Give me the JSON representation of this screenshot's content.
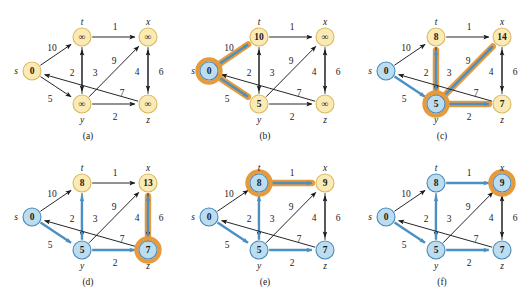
{
  "figure": {
    "width": 531,
    "height": 292,
    "colors": {
      "node_yellow_fill": "#fbeab4",
      "node_yellow_stroke": "#d8ba62",
      "node_blue_fill": "#bcdcf0",
      "node_blue_stroke": "#4a89b8",
      "highlight_orange": "#e79a3c",
      "edge_blue": "#4a90c2",
      "edge_black": "#1a1a1a",
      "text": "#1a1a1a"
    }
  },
  "graph": {
    "vertex_names": [
      "s",
      "t",
      "x",
      "y",
      "z"
    ],
    "positions": {
      "s": [
        32,
        71
      ],
      "t": [
        82,
        37
      ],
      "x": [
        148,
        37
      ],
      "y": [
        82,
        104
      ],
      "z": [
        148,
        104
      ]
    },
    "edges": [
      {
        "id": "s-t",
        "from": "s",
        "to": "t",
        "weight": "10",
        "label_pos": [
          52,
          48
        ]
      },
      {
        "id": "s-y",
        "from": "s",
        "to": "y",
        "weight": "5",
        "label_pos": [
          50,
          99
        ]
      },
      {
        "id": "t-x",
        "from": "t",
        "to": "x",
        "weight": "1",
        "label_pos": [
          115,
          27
        ]
      },
      {
        "id": "t-y",
        "from": "t",
        "to": "y",
        "weight": "2",
        "label_pos": [
          72,
          73
        ]
      },
      {
        "id": "y-t",
        "from": "y",
        "to": "t",
        "weight": "3",
        "label_pos": [
          95,
          73
        ]
      },
      {
        "id": "y-x",
        "from": "y",
        "to": "x",
        "weight": "9",
        "label_pos": [
          114,
          61
        ]
      },
      {
        "id": "x-z",
        "from": "x",
        "to": "z",
        "weight": "4",
        "label_pos": [
          137,
          72
        ]
      },
      {
        "id": "z-x",
        "from": "z",
        "to": "x",
        "weight": "6",
        "label_pos": [
          161,
          72
        ]
      },
      {
        "id": "y-z",
        "from": "y",
        "to": "z",
        "weight": "2",
        "label_pos": [
          115,
          117
        ]
      },
      {
        "id": "z-s",
        "from": "z",
        "to": "s",
        "weight": "7",
        "label_pos": [
          122,
          93
        ]
      }
    ]
  },
  "panels": [
    {
      "id": "a",
      "caption": "(a)",
      "origin": [
        0,
        0
      ],
      "values": {
        "s": "0",
        "t": "∞",
        "x": "∞",
        "y": "∞",
        "z": "∞"
      },
      "node_colors": {
        "s": "yellow",
        "t": "yellow",
        "x": "yellow",
        "y": "yellow",
        "z": "yellow"
      },
      "ring": null,
      "blue_edges": [],
      "orange_edges": []
    },
    {
      "id": "b",
      "caption": "(b)",
      "origin": [
        177,
        0
      ],
      "values": {
        "s": "0",
        "t": "10",
        "x": "∞",
        "y": "5",
        "z": "∞"
      },
      "node_colors": {
        "s": "blue",
        "t": "yellow",
        "x": "yellow",
        "y": "yellow",
        "z": "yellow"
      },
      "ring": "s",
      "blue_edges": [
        "s-t",
        "s-y"
      ],
      "orange_edges": [
        "s-t",
        "s-y"
      ]
    },
    {
      "id": "c",
      "caption": "(c)",
      "origin": [
        354,
        0
      ],
      "values": {
        "s": "0",
        "t": "8",
        "x": "14",
        "y": "5",
        "z": "7"
      },
      "node_colors": {
        "s": "blue",
        "t": "yellow",
        "x": "yellow",
        "y": "blue",
        "z": "yellow"
      },
      "ring": "y",
      "blue_edges": [
        "s-y",
        "y-t",
        "y-x",
        "y-z"
      ],
      "orange_edges": [
        "y-t",
        "y-x",
        "y-z"
      ]
    },
    {
      "id": "d",
      "caption": "(d)",
      "origin": [
        0,
        146
      ],
      "values": {
        "s": "0",
        "t": "8",
        "x": "13",
        "y": "5",
        "z": "7"
      },
      "node_colors": {
        "s": "blue",
        "t": "yellow",
        "x": "yellow",
        "y": "blue",
        "z": "blue"
      },
      "ring": "z",
      "blue_edges": [
        "s-y",
        "y-t",
        "y-z",
        "z-x"
      ],
      "orange_edges": [
        "z-x"
      ]
    },
    {
      "id": "e",
      "caption": "(e)",
      "origin": [
        177,
        146
      ],
      "values": {
        "s": "0",
        "t": "8",
        "x": "9",
        "y": "5",
        "z": "7"
      },
      "node_colors": {
        "s": "blue",
        "t": "blue",
        "x": "yellow",
        "y": "blue",
        "z": "blue"
      },
      "ring": "t",
      "blue_edges": [
        "s-y",
        "y-t",
        "y-z",
        "t-x"
      ],
      "orange_edges": [
        "t-x"
      ]
    },
    {
      "id": "f",
      "caption": "(f)",
      "origin": [
        354,
        146
      ],
      "values": {
        "s": "0",
        "t": "8",
        "x": "9",
        "y": "5",
        "z": "7"
      },
      "node_colors": {
        "s": "blue",
        "t": "blue",
        "x": "blue",
        "y": "blue",
        "z": "blue"
      },
      "ring": "x",
      "blue_edges": [
        "s-y",
        "y-t",
        "y-z",
        "t-x"
      ],
      "orange_edges": []
    }
  ]
}
